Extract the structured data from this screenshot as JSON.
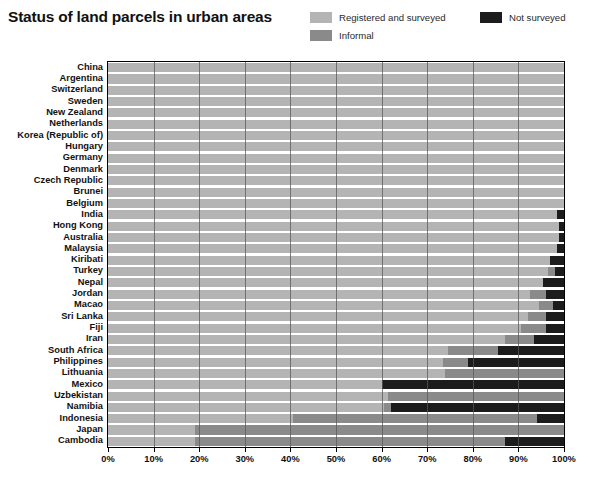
{
  "header": {
    "title": "Status of land parcels in urban areas"
  },
  "legend": {
    "position": "top-right",
    "items": [
      {
        "label": "Registered and surveyed",
        "color": "#b4b4b4"
      },
      {
        "label": "Informal",
        "color": "#8a8a8a"
      },
      {
        "label": "Not surveyed",
        "color": "#1c1c1c"
      }
    ]
  },
  "footnote": {
    "text": ""
  },
  "chart_data": {
    "type": "bar",
    "orientation": "horizontal",
    "stacked": true,
    "normalized": true,
    "title": "Status of land parcels in urban areas",
    "xlabel": "",
    "ylabel": "",
    "xlim": [
      0,
      100
    ],
    "xticks": [
      0,
      10,
      20,
      30,
      40,
      50,
      60,
      70,
      80,
      90,
      100
    ],
    "xtick_labels": [
      "0%",
      "10%",
      "20%",
      "30%",
      "40%",
      "50%",
      "60%",
      "70%",
      "80%",
      "90%",
      "100%"
    ],
    "grid": "vertical",
    "legend_position": "top-right",
    "series": [
      {
        "name": "Registered and surveyed",
        "color": "#b4b4b4"
      },
      {
        "name": "Informal",
        "color": "#8a8a8a"
      },
      {
        "name": "Not surveyed",
        "color": "#1c1c1c"
      }
    ],
    "categories": [
      "China",
      "Argentina",
      "Switzerland",
      "Sweden",
      "New Zealand",
      "Netherlands",
      "Korea (Republic of)",
      "Hungary",
      "Germany",
      "Denmark",
      "Czech Republic",
      "Brunei",
      "Belgium",
      "India",
      "Hong Kong",
      "Australia",
      "Malaysia",
      "Kiribati",
      "Turkey",
      "Nepal",
      "Jordan",
      "Macao",
      "Sri Lanka",
      "Fiji",
      "Iran",
      "South Africa",
      "Philippines",
      "Lithuania",
      "Mexico",
      "Uzbekistan",
      "Namibia",
      "Indonesia",
      "Japan",
      "Cambodia"
    ],
    "rows": [
      {
        "category": "China",
        "registered_and_surveyed": 100.0,
        "informal": 0.0,
        "not_surveyed": 0.0
      },
      {
        "category": "Argentina",
        "registered_and_surveyed": 100.0,
        "informal": 0.0,
        "not_surveyed": 0.0
      },
      {
        "category": "Switzerland",
        "registered_and_surveyed": 100.0,
        "informal": 0.0,
        "not_surveyed": 0.0
      },
      {
        "category": "Sweden",
        "registered_and_surveyed": 100.0,
        "informal": 0.0,
        "not_surveyed": 0.0
      },
      {
        "category": "New Zealand",
        "registered_and_surveyed": 100.0,
        "informal": 0.0,
        "not_surveyed": 0.0
      },
      {
        "category": "Netherlands",
        "registered_and_surveyed": 100.0,
        "informal": 0.0,
        "not_surveyed": 0.0
      },
      {
        "category": "Korea (Republic of)",
        "registered_and_surveyed": 100.0,
        "informal": 0.0,
        "not_surveyed": 0.0
      },
      {
        "category": "Hungary",
        "registered_and_surveyed": 100.0,
        "informal": 0.0,
        "not_surveyed": 0.0
      },
      {
        "category": "Germany",
        "registered_and_surveyed": 100.0,
        "informal": 0.0,
        "not_surveyed": 0.0
      },
      {
        "category": "Denmark",
        "registered_and_surveyed": 100.0,
        "informal": 0.0,
        "not_surveyed": 0.0
      },
      {
        "category": "Czech Republic",
        "registered_and_surveyed": 100.0,
        "informal": 0.0,
        "not_surveyed": 0.0
      },
      {
        "category": "Brunei",
        "registered_and_surveyed": 100.0,
        "informal": 0.0,
        "not_surveyed": 0.0
      },
      {
        "category": "Belgium",
        "registered_and_surveyed": 100.0,
        "informal": 0.0,
        "not_surveyed": 0.0
      },
      {
        "category": "India",
        "registered_and_surveyed": 98.5,
        "informal": 0.0,
        "not_surveyed": 1.5
      },
      {
        "category": "Hong Kong",
        "registered_and_surveyed": 99.0,
        "informal": 0.0,
        "not_surveyed": 1.0
      },
      {
        "category": "Australia",
        "registered_and_surveyed": 99.0,
        "informal": 0.0,
        "not_surveyed": 1.0
      },
      {
        "category": "Malaysia",
        "registered_and_surveyed": 98.5,
        "informal": 0.0,
        "not_surveyed": 1.5
      },
      {
        "category": "Kiribati",
        "registered_and_surveyed": 97.0,
        "informal": 0.0,
        "not_surveyed": 3.0
      },
      {
        "category": "Turkey",
        "registered_and_surveyed": 96.5,
        "informal": 1.5,
        "not_surveyed": 2.0
      },
      {
        "category": "Nepal",
        "registered_and_surveyed": 95.5,
        "informal": 0.0,
        "not_surveyed": 4.5
      },
      {
        "category": "Jordan",
        "registered_and_surveyed": 92.5,
        "informal": 3.5,
        "not_surveyed": 4.0
      },
      {
        "category": "Macao",
        "registered_and_surveyed": 94.5,
        "informal": 3.0,
        "not_surveyed": 2.5
      },
      {
        "category": "Sri Lanka",
        "registered_and_surveyed": 92.0,
        "informal": 4.0,
        "not_surveyed": 4.0
      },
      {
        "category": "Fiji",
        "registered_and_surveyed": 90.5,
        "informal": 5.5,
        "not_surveyed": 4.0
      },
      {
        "category": "Iran",
        "registered_and_surveyed": 87.0,
        "informal": 6.5,
        "not_surveyed": 6.5
      },
      {
        "category": "South Africa",
        "registered_and_surveyed": 74.5,
        "informal": 11.0,
        "not_surveyed": 14.5
      },
      {
        "category": "Philippines",
        "registered_and_surveyed": 73.5,
        "informal": 5.5,
        "not_surveyed": 21.0
      },
      {
        "category": "Lithuania",
        "registered_and_surveyed": 74.0,
        "informal": 26.0,
        "not_surveyed": 0.0
      },
      {
        "category": "Mexico",
        "registered_and_surveyed": 60.0,
        "informal": 0.0,
        "not_surveyed": 40.0
      },
      {
        "category": "Uzbekistan",
        "registered_and_surveyed": 61.5,
        "informal": 38.5,
        "not_surveyed": 0.0
      },
      {
        "category": "Namibia",
        "registered_and_surveyed": 60.5,
        "informal": 1.5,
        "not_surveyed": 38.0
      },
      {
        "category": "Indonesia",
        "registered_and_surveyed": 40.5,
        "informal": 53.5,
        "not_surveyed": 6.0
      },
      {
        "category": "Japan",
        "registered_and_surveyed": 19.0,
        "informal": 81.0,
        "not_surveyed": 0.0
      },
      {
        "category": "Cambodia",
        "registered_and_surveyed": 19.0,
        "informal": 68.0,
        "not_surveyed": 13.0
      }
    ]
  }
}
